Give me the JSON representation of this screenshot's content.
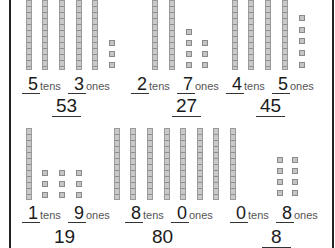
{
  "worksheet": {
    "unit_tens": "tens",
    "unit_ones": "ones",
    "block_color": "#c4c4c4",
    "problems": [
      {
        "tens": "5",
        "ones": "3",
        "total": "53"
      },
      {
        "tens": "2",
        "ones": "7",
        "total": "27"
      },
      {
        "tens": "4",
        "ones": "5",
        "total": "45"
      },
      {
        "tens": "1",
        "ones": "9",
        "total": "19"
      },
      {
        "tens": "8",
        "ones": "0",
        "total": "80"
      },
      {
        "tens": "0",
        "ones": "8",
        "total": "8"
      }
    ]
  }
}
